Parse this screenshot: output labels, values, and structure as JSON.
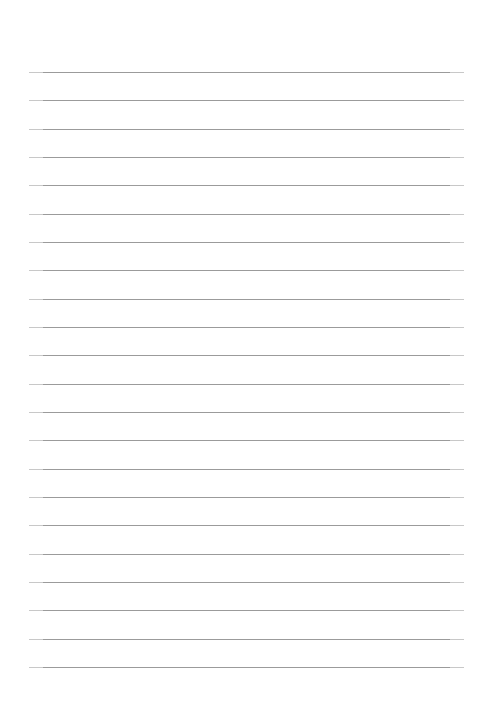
{
  "document": {
    "kind": "ruled-paper-sheet",
    "title": "Lined Paper",
    "page_width_px": 479,
    "page_height_px": 721,
    "background_color": "#ffffff",
    "content_text": ""
  },
  "rules": {
    "count": 22,
    "line_color": "#9b9b9b",
    "line_thickness_px": 1,
    "left_margin_px": 29,
    "right_edge_px": 464,
    "line_length_px": 435,
    "first_line_y_px": 72,
    "last_line_y_px": 667,
    "line_spacing_px": 28.33,
    "y_positions": [
      72,
      100,
      129,
      157,
      185,
      214,
      242,
      270,
      299,
      327,
      355,
      384,
      412,
      440,
      469,
      497,
      525,
      554,
      582,
      610,
      639,
      667
    ]
  },
  "margins": {
    "top_blank_px": 72,
    "bottom_blank_px": 54,
    "left_blank_px": 29,
    "right_blank_px": 15
  }
}
